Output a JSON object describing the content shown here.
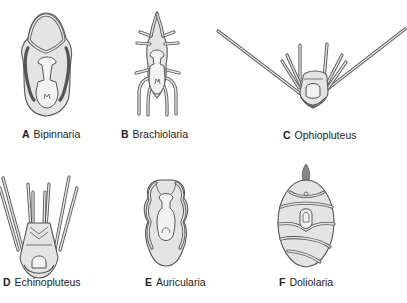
{
  "figure": {
    "panels": [
      {
        "letter": "A",
        "name": "Bipinnaria"
      },
      {
        "letter": "B",
        "name": "Brachiolaria"
      },
      {
        "letter": "C",
        "name": "Ophiopluteus"
      },
      {
        "letter": "D",
        "name": "Echinopluteus"
      },
      {
        "letter": "E",
        "name": "Auricularia"
      },
      {
        "letter": "F",
        "name": "Doliolaria"
      }
    ],
    "colors": {
      "outline": "#555555",
      "body_fill": "#e4e4e4",
      "label_text": "#222222",
      "background": "#ffffff"
    }
  }
}
